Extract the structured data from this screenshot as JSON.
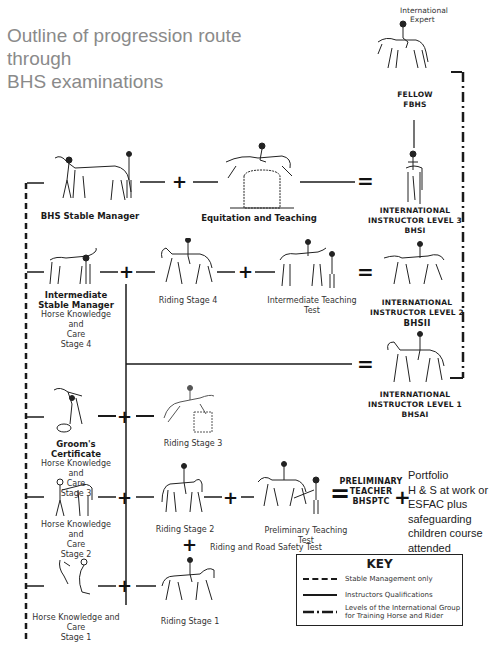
{
  "title": "Outline of progression route through BHS examinations",
  "title_lines": [
    "Outline of progression route through",
    "BHS examinations"
  ],
  "nodes": {
    "international_expert": {
      "label_lines": [
        "International",
        "Expert"
      ]
    },
    "fellow": {
      "label_lines": [
        "FELLOW",
        "FBHS"
      ]
    },
    "bhs_stable_manager": {
      "label": "BHS Stable Manager"
    },
    "equitation_teaching": {
      "label": "Equitation and Teaching"
    },
    "instructor_level3": {
      "label_lines": [
        "INTERNATIONAL",
        "INSTRUCTOR LEVEL 3",
        "BHSI"
      ]
    },
    "intermediate_stable_manager": {
      "title_lines": [
        "Intermediate",
        "Stable Manager"
      ],
      "sub_lines": [
        "Horse Knowledge and",
        "Care",
        "Stage 4"
      ]
    },
    "riding_stage4": {
      "label": "Riding Stage 4"
    },
    "intermediate_teaching_test": {
      "label": "Intermediate Teaching Test"
    },
    "instructor_level2": {
      "label_lines": [
        "INTERNATIONAL",
        "INSTRUCTOR LEVEL 2",
        "BHSII"
      ]
    },
    "instructor_level1": {
      "label_lines": [
        "INTERNATIONAL",
        "INSTRUCTOR LEVEL 1",
        "BHSAI"
      ]
    },
    "grooms_certificate": {
      "title": "Groom's Certificate",
      "sub_lines": [
        "Horse Knowledge and",
        "Care",
        "Stage 3"
      ]
    },
    "riding_stage3": {
      "label": "Riding Stage 3"
    },
    "hkc_stage2": {
      "sub_lines": [
        "Horse Knowledge and",
        "Care",
        "Stage 2"
      ]
    },
    "riding_stage2": {
      "label": "Riding Stage 2"
    },
    "preliminary_teaching_test": {
      "label": "Preliminary Teaching Test"
    },
    "riding_road_safety": {
      "label": "Riding and Road Safety Test"
    },
    "preliminary_teacher": {
      "label_lines": [
        "PRELIMINARY",
        "TEACHER",
        "BHSPTC"
      ]
    },
    "portfolio": {
      "lines": [
        "Portfolio",
        "H & S at work or",
        "ESFAC plus",
        "safeguarding",
        "children course",
        "attended"
      ]
    },
    "hkc_stage1": {
      "sub_lines": [
        "Horse Knowledge and Care",
        "Stage 1"
      ]
    },
    "riding_stage1": {
      "label": "Riding Stage 1"
    }
  },
  "operators": {
    "plus": "+",
    "equals": "="
  },
  "key": {
    "title": "KEY",
    "items": [
      {
        "style": "dashed",
        "label": "Stable Management only"
      },
      {
        "style": "solid",
        "label": "Instructors Qualifications"
      },
      {
        "style": "dash-dot",
        "label_lines": [
          "Levels of the International Group",
          "for Training Horse and Rider"
        ]
      }
    ]
  },
  "colors": {
    "title": "#8a8a8a",
    "line": "#1a1a1a",
    "text": "#333333"
  }
}
